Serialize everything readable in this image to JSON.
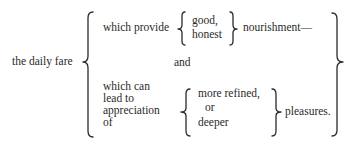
{
  "diagram": {
    "type": "brace-outline",
    "subject": "the daily fare",
    "branches": [
      {
        "lead": "which provide",
        "options": [
          "good,",
          "honest"
        ],
        "tail": "nourishment—"
      },
      {
        "connector": "and"
      },
      {
        "lead_lines": [
          "which can",
          "lead to",
          "appreciation",
          "of"
        ],
        "options": [
          "more refined,",
          "or",
          "deeper"
        ],
        "tail": "pleasures."
      }
    ]
  }
}
